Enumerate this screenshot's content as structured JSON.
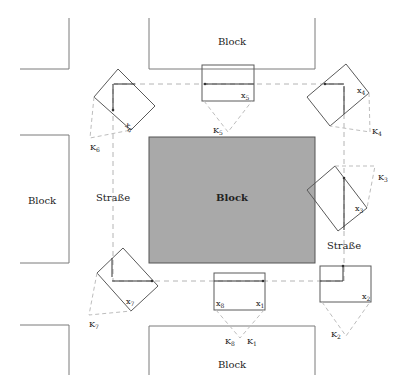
{
  "diagram": {
    "blocks": {
      "top": "Block",
      "center": "Block",
      "left": "Block",
      "bottom": "Block"
    },
    "streets": {
      "left": "Straße",
      "right": "Straße"
    },
    "vehicles": [
      {
        "id": "1",
        "label": "x",
        "sub": "1"
      },
      {
        "id": "2",
        "label": "x",
        "sub": "2"
      },
      {
        "id": "3",
        "label": "x",
        "sub": "3"
      },
      {
        "id": "4",
        "label": "x",
        "sub": "4"
      },
      {
        "id": "5",
        "label": "x",
        "sub": "5"
      },
      {
        "id": "6",
        "label": "x",
        "sub": "6"
      },
      {
        "id": "7",
        "label": "x",
        "sub": "7"
      },
      {
        "id": "8",
        "label": "x",
        "sub": "8"
      }
    ],
    "cameras": [
      {
        "id": "1",
        "label": "K",
        "sub": "1"
      },
      {
        "id": "2",
        "label": "K",
        "sub": "2"
      },
      {
        "id": "3",
        "label": "K",
        "sub": "3"
      },
      {
        "id": "4",
        "label": "K",
        "sub": "4"
      },
      {
        "id": "5",
        "label": "K",
        "sub": "5"
      },
      {
        "id": "6",
        "label": "K",
        "sub": "6"
      },
      {
        "id": "7",
        "label": "K",
        "sub": "7"
      },
      {
        "id": "8",
        "label": "K",
        "sub": "8"
      }
    ],
    "colors": {
      "center_block_fill": "#a9a9a9",
      "outline": "#7a7a7a",
      "path_dashed": "#b4b4b4"
    }
  }
}
